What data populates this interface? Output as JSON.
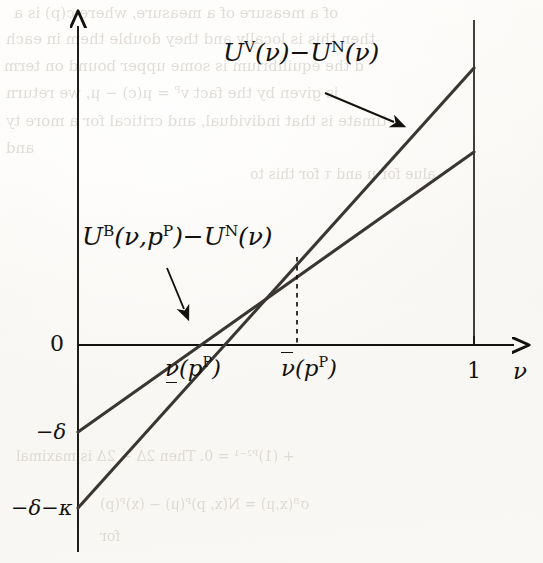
{
  "figure": {
    "kind": "line-diagram",
    "background_color": "#fbfaf7",
    "ink_color": "#14120f",
    "ghost_text_color": "#b9b2a8"
  },
  "axes": {
    "x_axis_label": "ν",
    "y_axis_label": "",
    "origin_label": "0",
    "x_tick_one": "1",
    "x_tick_lower": "ν",
    "x_tick_lower_sub": "(p",
    "x_tick_lower_sup": "P",
    "x_tick_lower_close": ")",
    "x_tick_upper": "ν",
    "y_tick_delta": "−δ",
    "y_tick_delta_kappa": "−δ−κ"
  },
  "curve_labels": {
    "steep": {
      "u_letter": "U",
      "u_sup": "V",
      "arg": "(ν)",
      "minus": "−",
      "u2_letter": "U",
      "u2_sup": "N",
      "arg2": "(ν)"
    },
    "flat": {
      "u_letter": "U",
      "u_sup": "B",
      "arg": "(ν,p",
      "arg_sup": "P",
      "arg_close": ")",
      "minus": "−",
      "u2_letter": "U",
      "u2_sup": "N",
      "arg2": "(ν)"
    }
  },
  "chart_data": {
    "type": "line",
    "title": "",
    "xlabel": "ν",
    "ylabel": "",
    "xlim": [
      0,
      1
    ],
    "grid": false,
    "legend": "inline-annotations",
    "x_ticks": [
      {
        "value": 0.34,
        "label": "ν̲(pᴾ)"
      },
      {
        "value": 0.553,
        "label": "ν̄(pᴾ)"
      },
      {
        "value": 1.0,
        "label": "1"
      }
    ],
    "y_ticks": [
      {
        "value": 0,
        "label": "0"
      },
      {
        "value": -0.22,
        "label": "−δ"
      },
      {
        "value": -0.41,
        "label": "−δ−κ"
      }
    ],
    "series": [
      {
        "name": "U^V(ν) − U^N(ν)",
        "style": "solid",
        "points": [
          [
            0,
            -0.41
          ],
          [
            1,
            0.7
          ]
        ],
        "zero_crossing": 0.24,
        "slope_note": "steeper"
      },
      {
        "name": "U^B(ν,p^P) − U^N(ν)",
        "style": "solid",
        "points": [
          [
            0,
            -0.22
          ],
          [
            1,
            0.48
          ]
        ],
        "zero_crossing": 0.34,
        "slope_note": "flatter"
      }
    ],
    "intersection": {
      "x": 0.553,
      "y": 0.22,
      "dropline": "dashed"
    },
    "annotations": [
      {
        "text": "U^V(ν) − U^N(ν)",
        "points_to": "steep-line"
      },
      {
        "text": "U^B(ν,p^P) − U^N(ν)",
        "points_to": "flat-line"
      }
    ]
  },
  "ghost_text": [
    {
      "t": "of a measure of a measure, where c(p) is a",
      "x": 14,
      "y": 4,
      "size": 15
    },
    {
      "t": "then this is locally and they double them in each",
      "x": 6,
      "y": 30,
      "size": 15
    },
    {
      "t": "d the equilibrium is some upper bound on term",
      "x": 4,
      "y": 57,
      "size": 15
    },
    {
      "t": "is given by the fact vᴾ = μ(c) − μ, we return",
      "x": 6,
      "y": 84,
      "size": 15
    },
    {
      "t": "timate is that individual, and critical for a more ty",
      "x": 6,
      "y": 112,
      "size": 15
    },
    {
      "t": "and",
      "x": 6,
      "y": 139,
      "size": 15
    },
    {
      "t": "alue for μ and τ for this  to",
      "x": 250,
      "y": 166,
      "size": 14
    },
    {
      "t": "+ (1)ᴾ²⁻¹ = 0. Then 2Δ − 2Δ is maximal",
      "x": 16,
      "y": 448,
      "size": 14
    },
    {
      "t": "σᴮ(x,μ) = N(x, p)ᴾ(μ) − (x)ᴾ(p)",
      "x": 100,
      "y": 496,
      "size": 14
    },
    {
      "t": "for",
      "x": 100,
      "y": 528,
      "size": 14
    }
  ]
}
